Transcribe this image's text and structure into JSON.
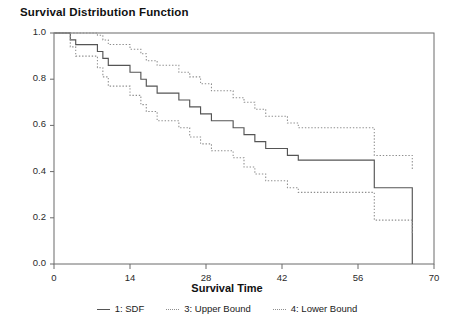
{
  "chart_data": {
    "type": "line",
    "title": "Survival Distribution Function",
    "xlabel": "Survival Time",
    "ylabel": "",
    "xlim": [
      0,
      70
    ],
    "ylim": [
      0.0,
      1.0
    ],
    "grid": false,
    "legend_position": "bottom",
    "x_ticks": [
      0,
      14,
      28,
      42,
      56,
      70
    ],
    "x_tick_labels": [
      "0",
      "14",
      "28",
      "42",
      "56",
      "70"
    ],
    "y_ticks": [
      0.0,
      0.2,
      0.4,
      0.6,
      0.8,
      1.0
    ],
    "y_tick_labels": [
      "0.0",
      "0.2",
      "0.4",
      "0.6",
      "0.8",
      "1.0"
    ],
    "step_type": "post",
    "series": [
      {
        "name": "1: SDF",
        "style": "solid",
        "color": "#555555",
        "x": [
          0,
          2,
          3,
          4,
          6,
          8,
          9,
          10,
          12,
          14,
          16,
          17,
          19,
          21,
          23,
          25,
          27,
          29,
          31,
          33,
          35,
          37,
          39,
          41,
          43,
          45,
          47,
          51,
          59,
          66,
          66
        ],
        "y": [
          1.0,
          1.0,
          0.97,
          0.95,
          0.95,
          0.92,
          0.89,
          0.86,
          0.86,
          0.83,
          0.8,
          0.77,
          0.74,
          0.74,
          0.71,
          0.68,
          0.65,
          0.62,
          0.62,
          0.59,
          0.56,
          0.53,
          0.5,
          0.5,
          0.47,
          0.45,
          0.45,
          0.45,
          0.33,
          0.27,
          0.0
        ]
      },
      {
        "name": "3: Upper Bound",
        "style": "dotted",
        "color": "#8e8e8e",
        "x": [
          0,
          2,
          3,
          4,
          6,
          8,
          9,
          10,
          12,
          14,
          16,
          17,
          19,
          21,
          23,
          25,
          27,
          29,
          31,
          33,
          35,
          37,
          39,
          41,
          43,
          45,
          47,
          51,
          59,
          66
        ],
        "y": [
          1.0,
          1.0,
          1.0,
          1.0,
          1.0,
          0.99,
          0.97,
          0.95,
          0.95,
          0.93,
          0.91,
          0.88,
          0.86,
          0.86,
          0.83,
          0.81,
          0.78,
          0.75,
          0.75,
          0.72,
          0.7,
          0.67,
          0.64,
          0.64,
          0.61,
          0.59,
          0.59,
          0.59,
          0.47,
          0.41
        ]
      },
      {
        "name": "4: Lower Bound",
        "style": "dotted",
        "color": "#8e8e8e",
        "x": [
          0,
          2,
          3,
          4,
          6,
          8,
          9,
          10,
          12,
          14,
          16,
          17,
          19,
          21,
          23,
          25,
          27,
          29,
          31,
          33,
          35,
          37,
          39,
          41,
          43,
          45,
          47,
          51,
          59,
          66
        ],
        "y": [
          1.0,
          1.0,
          0.94,
          0.9,
          0.9,
          0.85,
          0.81,
          0.77,
          0.77,
          0.73,
          0.69,
          0.66,
          0.62,
          0.62,
          0.59,
          0.55,
          0.52,
          0.49,
          0.49,
          0.46,
          0.42,
          0.39,
          0.36,
          0.36,
          0.33,
          0.31,
          0.31,
          0.31,
          0.19,
          0.13
        ]
      }
    ]
  },
  "legend": {
    "entries": [
      {
        "label": "1: SDF",
        "style": "solid"
      },
      {
        "label": "3: Upper Bound",
        "style": "dotted"
      },
      {
        "label": "4: Lower Bound",
        "style": "dotted"
      }
    ]
  }
}
